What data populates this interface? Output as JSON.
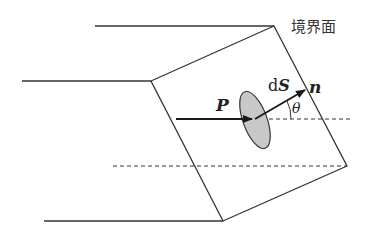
{
  "diagram": {
    "labels": {
      "boundary": "境界面",
      "polarization": "P",
      "area_element_d": "d",
      "area_element_S": "S",
      "normal": "n",
      "angle": "θ"
    },
    "colors": {
      "line": "#333333",
      "ellipse_fill": "#c8c8c8",
      "ellipse_stroke": "#333333",
      "background": "#ffffff"
    }
  }
}
